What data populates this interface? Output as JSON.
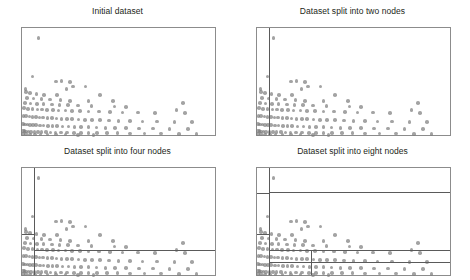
{
  "figure": {
    "width": 470,
    "height": 280,
    "background": "#ffffff",
    "dot_color": "#808080",
    "frame_color": "#8c8c8c",
    "split_color": "#5a5a5a",
    "title_color": "#231f20"
  },
  "panels": [
    {
      "title": "Initial dataset"
    },
    {
      "title": "Dataset split into two nodes"
    },
    {
      "title": "Dataset split into four nodes"
    },
    {
      "title": "Dataset split into eight nodes"
    }
  ],
  "chart_data": {
    "type": "scatter",
    "xlabel": "",
    "ylabel": "",
    "xlim": [
      0,
      1
    ],
    "ylim": [
      0,
      1
    ],
    "grid": false,
    "legend": null,
    "marker": {
      "color": "#808080",
      "opacity": 0.72,
      "size_px": 3.6,
      "shape": "circle"
    },
    "points": [
      [
        0.085,
        0.905
      ],
      [
        0.055,
        0.545
      ],
      [
        0.175,
        0.5
      ],
      [
        0.205,
        0.505
      ],
      [
        0.25,
        0.495
      ],
      [
        0.265,
        0.455
      ],
      [
        0.23,
        0.43
      ],
      [
        0.33,
        0.455
      ],
      [
        0.018,
        0.43
      ],
      [
        0.022,
        0.4
      ],
      [
        0.04,
        0.395
      ],
      [
        0.075,
        0.385
      ],
      [
        0.115,
        0.375
      ],
      [
        0.18,
        0.372
      ],
      [
        0.405,
        0.372
      ],
      [
        0.025,
        0.345
      ],
      [
        0.06,
        0.34
      ],
      [
        0.1,
        0.335
      ],
      [
        0.145,
        0.33
      ],
      [
        0.2,
        0.325
      ],
      [
        0.25,
        0.32
      ],
      [
        0.345,
        0.318
      ],
      [
        0.47,
        0.315
      ],
      [
        0.015,
        0.3
      ],
      [
        0.045,
        0.295
      ],
      [
        0.078,
        0.29
      ],
      [
        0.112,
        0.288
      ],
      [
        0.155,
        0.285
      ],
      [
        0.195,
        0.282
      ],
      [
        0.238,
        0.278
      ],
      [
        0.29,
        0.275
      ],
      [
        0.36,
        0.272
      ],
      [
        0.48,
        0.268
      ],
      [
        0.54,
        0.262
      ],
      [
        0.835,
        0.3
      ],
      [
        0.01,
        0.25
      ],
      [
        0.03,
        0.245
      ],
      [
        0.055,
        0.242
      ],
      [
        0.08,
        0.24
      ],
      [
        0.105,
        0.238
      ],
      [
        0.13,
        0.235
      ],
      [
        0.16,
        0.232
      ],
      [
        0.19,
        0.23
      ],
      [
        0.225,
        0.228
      ],
      [
        0.26,
        0.225
      ],
      [
        0.3,
        0.222
      ],
      [
        0.345,
        0.22
      ],
      [
        0.4,
        0.218
      ],
      [
        0.455,
        0.215
      ],
      [
        0.52,
        0.212
      ],
      [
        0.6,
        0.21
      ],
      [
        0.69,
        0.208
      ],
      [
        0.8,
        0.235
      ],
      [
        0.845,
        0.205
      ],
      [
        0.008,
        0.18
      ],
      [
        0.022,
        0.175
      ],
      [
        0.038,
        0.172
      ],
      [
        0.055,
        0.17
      ],
      [
        0.072,
        0.168
      ],
      [
        0.09,
        0.165
      ],
      [
        0.11,
        0.163
      ],
      [
        0.132,
        0.16
      ],
      [
        0.155,
        0.158
      ],
      [
        0.178,
        0.155
      ],
      [
        0.205,
        0.152
      ],
      [
        0.232,
        0.15
      ],
      [
        0.26,
        0.148
      ],
      [
        0.292,
        0.145
      ],
      [
        0.325,
        0.142
      ],
      [
        0.362,
        0.14
      ],
      [
        0.405,
        0.138
      ],
      [
        0.45,
        0.135
      ],
      [
        0.5,
        0.132
      ],
      [
        0.56,
        0.13
      ],
      [
        0.625,
        0.128
      ],
      [
        0.7,
        0.126
      ],
      [
        0.79,
        0.124
      ],
      [
        0.88,
        0.122
      ],
      [
        0.006,
        0.105
      ],
      [
        0.016,
        0.1
      ],
      [
        0.028,
        0.098
      ],
      [
        0.042,
        0.096
      ],
      [
        0.058,
        0.094
      ],
      [
        0.074,
        0.092
      ],
      [
        0.092,
        0.09
      ],
      [
        0.112,
        0.088
      ],
      [
        0.134,
        0.086
      ],
      [
        0.158,
        0.084
      ],
      [
        0.182,
        0.082
      ],
      [
        0.21,
        0.08
      ],
      [
        0.24,
        0.078
      ],
      [
        0.272,
        0.076
      ],
      [
        0.306,
        0.074
      ],
      [
        0.344,
        0.072
      ],
      [
        0.386,
        0.07
      ],
      [
        0.432,
        0.068
      ],
      [
        0.482,
        0.066
      ],
      [
        0.54,
        0.064
      ],
      [
        0.605,
        0.062
      ],
      [
        0.68,
        0.06
      ],
      [
        0.765,
        0.058
      ],
      [
        0.86,
        0.056
      ],
      [
        0.004,
        0.04
      ],
      [
        0.012,
        0.036
      ],
      [
        0.022,
        0.034
      ],
      [
        0.034,
        0.032
      ],
      [
        0.048,
        0.03
      ],
      [
        0.064,
        0.029
      ],
      [
        0.082,
        0.028
      ],
      [
        0.102,
        0.027
      ],
      [
        0.124,
        0.026
      ],
      [
        0.148,
        0.025
      ],
      [
        0.174,
        0.024
      ],
      [
        0.202,
        0.023
      ],
      [
        0.234,
        0.022
      ],
      [
        0.268,
        0.021
      ],
      [
        0.305,
        0.02
      ],
      [
        0.345,
        0.019
      ],
      [
        0.39,
        0.018
      ],
      [
        0.44,
        0.017
      ],
      [
        0.495,
        0.016
      ],
      [
        0.56,
        0.015
      ],
      [
        0.635,
        0.014
      ],
      [
        0.72,
        0.013
      ],
      [
        0.815,
        0.012
      ],
      [
        0.905,
        0.011
      ],
      [
        0.006,
        0.008
      ],
      [
        0.02,
        0.007
      ],
      [
        0.04,
        0.006
      ],
      [
        0.066,
        0.005
      ],
      [
        0.096,
        0.004
      ],
      [
        0.132,
        0.004
      ],
      [
        0.175,
        0.003
      ],
      [
        0.225,
        0.003
      ],
      [
        0.29,
        0.002
      ],
      [
        0.37,
        0.002
      ]
    ],
    "splits": {
      "panel_1": [],
      "panel_2": [
        {
          "orient": "v",
          "pos": 0.062,
          "from": 0.0,
          "to": 1.0
        }
      ],
      "panel_3": [
        {
          "orient": "v",
          "pos": 0.062,
          "from": 0.0,
          "to": 1.0
        },
        {
          "orient": "h",
          "pos": 0.385,
          "from": 0.0,
          "to": 0.062
        },
        {
          "orient": "h",
          "pos": 0.235,
          "from": 0.062,
          "to": 1.0
        }
      ],
      "panel_4": [
        {
          "orient": "v",
          "pos": 0.062,
          "from": 0.0,
          "to": 1.0
        },
        {
          "orient": "h",
          "pos": 0.385,
          "from": 0.0,
          "to": 0.062
        },
        {
          "orient": "h",
          "pos": 0.235,
          "from": 0.062,
          "to": 1.0
        },
        {
          "orient": "h",
          "pos": 0.77,
          "from": 0.0,
          "to": 0.062
        },
        {
          "orient": "h",
          "pos": 0.775,
          "from": 0.062,
          "to": 1.0
        },
        {
          "orient": "h",
          "pos": 0.125,
          "from": 0.062,
          "to": 1.0
        },
        {
          "orient": "v",
          "pos": 0.278,
          "from": 0.0,
          "to": 0.235
        }
      ]
    }
  }
}
